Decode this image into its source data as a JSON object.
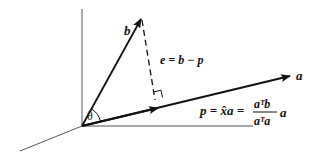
{
  "diagram": {
    "type": "vector-projection",
    "vectors": {
      "a": {
        "label": "a"
      },
      "b": {
        "label": "b"
      }
    },
    "angle_label": "θ",
    "error_label": "e = b − p",
    "projection_formula": {
      "lhs": "p = x̂a =",
      "numerator": "aᵀb",
      "denominator": "aᵀa",
      "suffix": "a"
    },
    "colors": {
      "stroke": "#111111",
      "axis": "#555555",
      "background": "#ffffff"
    }
  }
}
